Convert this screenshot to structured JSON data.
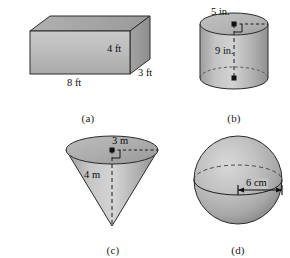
{
  "sheet": {
    "title": "Geometric solids with dimension labels",
    "background_color": "#ffffff",
    "ink_color": "#111111",
    "solid_fill_light": "#d8d8d8",
    "solid_fill_mid": "#b7b7b7",
    "solid_fill_dark": "#9a9a9a",
    "outline_color": "#2b2b2b"
  },
  "figures": [
    {
      "id": "a",
      "caption": "(a)",
      "shape": "rectangular-prism",
      "shape_name": "rectangular prism",
      "labels": {
        "length": "8 ft",
        "height": "4 ft",
        "depth": "3 ft"
      }
    },
    {
      "id": "b",
      "caption": "(b)",
      "shape": "cylinder",
      "shape_name": "cylinder",
      "labels": {
        "radius": "5 in.",
        "height": "9 in."
      }
    },
    {
      "id": "c",
      "caption": "(c)",
      "shape": "cone",
      "shape_name": "inverted cone",
      "labels": {
        "radius": "3 m",
        "height": "4 m"
      }
    },
    {
      "id": "d",
      "caption": "(d)",
      "shape": "sphere",
      "shape_name": "sphere",
      "labels": {
        "radius": "6 cm"
      }
    }
  ]
}
